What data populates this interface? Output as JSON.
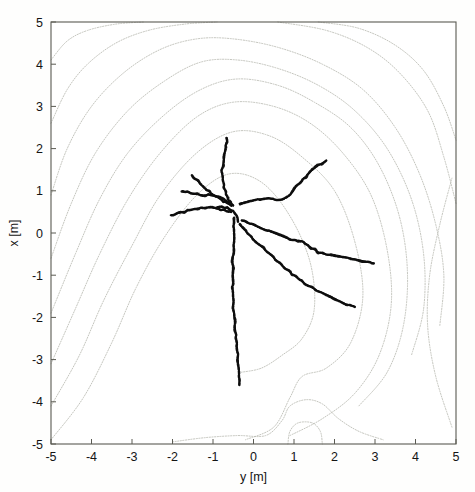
{
  "figure": {
    "background_color": "#fefefd",
    "frame_color": "#5a5a52",
    "contour_color": "#b9bab2",
    "trajectory_color": "#121212"
  },
  "chart_data": {
    "type": "line",
    "title": "",
    "subtitle": "",
    "xlabel": "y [m]",
    "ylabel": "x [m]",
    "xlim": [
      -5,
      5
    ],
    "ylim": [
      -5,
      5
    ],
    "xticks": [
      -5,
      -4,
      -3,
      -2,
      -1,
      0,
      1,
      2,
      3,
      4,
      5
    ],
    "yticks": [
      -5,
      -4,
      -3,
      -2,
      -1,
      0,
      1,
      2,
      3,
      4,
      5
    ],
    "xticklabels": [
      "-5",
      "-4",
      "-3",
      "-2",
      "-1",
      "0",
      "1",
      "2",
      "3",
      "4",
      "5"
    ],
    "yticklabels": [
      "-5",
      "-4",
      "-3",
      "-2",
      "-1",
      "0",
      "1",
      "2",
      "3",
      "4",
      "5"
    ],
    "grid": false,
    "legend": null,
    "annotations": [],
    "series": [
      {
        "name": "contour-level-1-outermost",
        "kind": "contour",
        "points": [
          [
            -5.0,
            4.1
          ],
          [
            -4.6,
            4.55
          ],
          [
            -4.1,
            4.8
          ],
          [
            -3.4,
            4.95
          ],
          [
            -2.7,
            5.0
          ]
        ]
      },
      {
        "name": "contour-level-1-right",
        "kind": "contour",
        "points": [
          [
            1.6,
            5.0
          ],
          [
            2.6,
            4.85
          ],
          [
            3.5,
            4.45
          ],
          [
            4.2,
            3.85
          ],
          [
            4.7,
            3.0
          ],
          [
            5.0,
            2.2
          ]
        ]
      },
      {
        "name": "contour-level-2",
        "kind": "contour",
        "points": [
          [
            -5.0,
            2.6
          ],
          [
            -4.6,
            3.4
          ],
          [
            -4.1,
            4.0
          ],
          [
            -3.4,
            4.5
          ],
          [
            -2.6,
            4.8
          ],
          [
            -1.7,
            4.95
          ],
          [
            -0.9,
            5.0
          ]
        ]
      },
      {
        "name": "contour-level-2-right",
        "kind": "contour",
        "points": [
          [
            0.6,
            5.0
          ],
          [
            1.8,
            4.8
          ],
          [
            2.8,
            4.4
          ],
          [
            3.6,
            3.8
          ],
          [
            4.3,
            2.9
          ],
          [
            4.7,
            1.8
          ],
          [
            5.0,
            0.7
          ]
        ]
      },
      {
        "name": "contour-level-3",
        "kind": "contour",
        "points": [
          [
            -5.0,
            0.9
          ],
          [
            -4.6,
            2.0
          ],
          [
            -4.0,
            3.0
          ],
          [
            -3.2,
            3.8
          ],
          [
            -2.3,
            4.35
          ],
          [
            -1.4,
            4.6
          ],
          [
            -0.5,
            4.6
          ],
          [
            0.6,
            4.4
          ],
          [
            1.7,
            4.0
          ],
          [
            2.7,
            3.4
          ],
          [
            3.5,
            2.5
          ],
          [
            4.1,
            1.4
          ],
          [
            4.5,
            0.2
          ],
          [
            4.7,
            -1.0
          ],
          [
            4.6,
            -2.2
          ]
        ]
      },
      {
        "name": "contour-level-4",
        "kind": "contour",
        "points": [
          [
            -5.0,
            -0.6
          ],
          [
            -4.5,
            0.7
          ],
          [
            -3.9,
            1.9
          ],
          [
            -3.1,
            2.9
          ],
          [
            -2.2,
            3.6
          ],
          [
            -1.3,
            4.05
          ],
          [
            -0.4,
            4.1
          ],
          [
            0.6,
            3.9
          ],
          [
            1.6,
            3.5
          ],
          [
            2.5,
            2.9
          ],
          [
            3.3,
            2.0
          ],
          [
            3.9,
            0.8
          ],
          [
            4.2,
            -0.5
          ],
          [
            4.2,
            -1.8
          ],
          [
            3.9,
            -2.9
          ]
        ]
      },
      {
        "name": "contour-level-5",
        "kind": "contour",
        "points": [
          [
            -5.0,
            -1.9
          ],
          [
            -4.4,
            -0.5
          ],
          [
            -3.8,
            0.8
          ],
          [
            -3.1,
            1.9
          ],
          [
            -2.2,
            2.8
          ],
          [
            -1.3,
            3.4
          ],
          [
            -0.4,
            3.65
          ],
          [
            0.6,
            3.5
          ],
          [
            1.5,
            3.1
          ],
          [
            2.4,
            2.5
          ],
          [
            3.1,
            1.6
          ],
          [
            3.6,
            0.4
          ],
          [
            3.8,
            -0.9
          ],
          [
            3.7,
            -2.2
          ],
          [
            3.3,
            -3.3
          ],
          [
            2.6,
            -4.1
          ]
        ]
      },
      {
        "name": "contour-level-6",
        "kind": "contour",
        "points": [
          [
            -5.0,
            -3.1
          ],
          [
            -4.4,
            -1.8
          ],
          [
            -3.8,
            -0.5
          ],
          [
            -3.1,
            0.8
          ],
          [
            -2.3,
            1.9
          ],
          [
            -1.4,
            2.75
          ],
          [
            -0.5,
            3.1
          ],
          [
            0.5,
            3.0
          ],
          [
            1.4,
            2.6
          ],
          [
            2.2,
            1.9
          ],
          [
            2.9,
            0.9
          ],
          [
            3.3,
            -0.4
          ],
          [
            3.4,
            -1.7
          ],
          [
            3.1,
            -2.9
          ],
          [
            2.5,
            -3.8
          ],
          [
            1.7,
            -4.4
          ],
          [
            0.9,
            -4.8
          ]
        ]
      },
      {
        "name": "contour-level-7",
        "kind": "contour",
        "points": [
          [
            -5.0,
            -4.1
          ],
          [
            -4.3,
            -2.9
          ],
          [
            -3.7,
            -1.6
          ],
          [
            -3.0,
            -0.3
          ],
          [
            -2.3,
            0.9
          ],
          [
            -1.4,
            1.9
          ],
          [
            -0.5,
            2.4
          ],
          [
            0.4,
            2.3
          ],
          [
            1.2,
            1.8
          ],
          [
            2.0,
            1.0
          ],
          [
            2.5,
            -0.2
          ],
          [
            2.7,
            -1.5
          ],
          [
            2.4,
            -2.6
          ],
          [
            1.8,
            -3.2
          ],
          [
            1.2,
            -3.4
          ],
          [
            0.9,
            -3.9
          ],
          [
            0.5,
            -4.6
          ],
          [
            -0.2,
            -4.9
          ]
        ]
      },
      {
        "name": "contour-level-8-inner",
        "kind": "contour",
        "points": [
          [
            -5.0,
            -4.9
          ],
          [
            -4.2,
            -3.9
          ],
          [
            -3.5,
            -2.6
          ],
          [
            -2.9,
            -1.3
          ],
          [
            -2.2,
            -0.1
          ],
          [
            -1.4,
            0.9
          ],
          [
            -0.6,
            1.4
          ],
          [
            0.2,
            1.2
          ],
          [
            0.9,
            0.4
          ],
          [
            1.4,
            -0.7
          ],
          [
            1.5,
            -1.8
          ],
          [
            1.2,
            -2.5
          ],
          [
            0.7,
            -2.9
          ],
          [
            0.2,
            -3.2
          ],
          [
            -0.3,
            -3.3
          ]
        ]
      },
      {
        "name": "contour-saddle-lower",
        "kind": "contour",
        "points": [
          [
            -2.0,
            -4.95
          ],
          [
            -1.2,
            -4.85
          ],
          [
            -0.4,
            -4.8
          ],
          [
            0.3,
            -4.8
          ],
          [
            0.7,
            -4.45
          ],
          [
            0.9,
            -4.1
          ],
          [
            1.3,
            -3.95
          ],
          [
            1.7,
            -4.05
          ],
          [
            2.1,
            -4.4
          ],
          [
            2.6,
            -4.7
          ],
          [
            3.2,
            -4.9
          ]
        ]
      },
      {
        "name": "contour-saddle-notch",
        "kind": "contour",
        "points": [
          [
            0.85,
            -5.0
          ],
          [
            0.9,
            -4.7
          ],
          [
            1.1,
            -4.5
          ],
          [
            1.45,
            -4.5
          ],
          [
            1.65,
            -4.7
          ],
          [
            1.7,
            -5.0
          ]
        ]
      },
      {
        "name": "contour-right-lobe",
        "kind": "contour",
        "points": [
          [
            4.9,
            -4.6
          ],
          [
            4.5,
            -3.4
          ],
          [
            4.3,
            -2.2
          ],
          [
            4.35,
            -1.0
          ],
          [
            4.6,
            0.2
          ],
          [
            4.9,
            1.3
          ]
        ]
      },
      {
        "name": "trajectory-north",
        "kind": "trajectory",
        "points": [
          [
            -0.65,
            2.25
          ],
          [
            -0.7,
            2.0
          ],
          [
            -0.72,
            1.75
          ],
          [
            -0.78,
            1.5
          ],
          [
            -0.75,
            1.25
          ],
          [
            -0.7,
            1.0
          ],
          [
            -0.62,
            0.78
          ],
          [
            -0.5,
            0.65
          ]
        ]
      },
      {
        "name": "trajectory-northwest",
        "kind": "trajectory",
        "points": [
          [
            -1.5,
            1.35
          ],
          [
            -1.35,
            1.2
          ],
          [
            -1.2,
            1.05
          ],
          [
            -1.05,
            0.95
          ],
          [
            -0.9,
            0.85
          ],
          [
            -0.75,
            0.75
          ],
          [
            -0.55,
            0.65
          ]
        ]
      },
      {
        "name": "trajectory-west-upper",
        "kind": "trajectory",
        "points": [
          [
            -1.75,
            1.0
          ],
          [
            -1.55,
            0.95
          ],
          [
            -1.3,
            0.9
          ],
          [
            -1.05,
            0.9
          ],
          [
            -0.85,
            0.85
          ],
          [
            -0.6,
            0.72
          ]
        ]
      },
      {
        "name": "trajectory-west-lower",
        "kind": "trajectory",
        "points": [
          [
            -2.05,
            0.42
          ],
          [
            -1.8,
            0.48
          ],
          [
            -1.55,
            0.55
          ],
          [
            -1.3,
            0.6
          ],
          [
            -1.05,
            0.6
          ],
          [
            -0.8,
            0.55
          ],
          [
            -0.55,
            0.5
          ]
        ]
      },
      {
        "name": "trajectory-south",
        "kind": "trajectory",
        "points": [
          [
            -0.5,
            0.35
          ],
          [
            -0.48,
            0.0
          ],
          [
            -0.5,
            -0.5
          ],
          [
            -0.52,
            -1.0
          ],
          [
            -0.5,
            -1.5
          ],
          [
            -0.48,
            -2.0
          ],
          [
            -0.42,
            -2.5
          ],
          [
            -0.38,
            -3.0
          ],
          [
            -0.35,
            -3.6
          ]
        ]
      },
      {
        "name": "trajectory-northeast",
        "kind": "trajectory",
        "points": [
          [
            -0.35,
            0.7
          ],
          [
            0.0,
            0.78
          ],
          [
            0.35,
            0.82
          ],
          [
            0.65,
            0.78
          ],
          [
            0.9,
            0.9
          ],
          [
            1.1,
            1.15
          ],
          [
            1.35,
            1.4
          ],
          [
            1.6,
            1.6
          ],
          [
            1.8,
            1.72
          ]
        ]
      },
      {
        "name": "trajectory-east",
        "kind": "trajectory",
        "points": [
          [
            -0.3,
            0.3
          ],
          [
            0.1,
            0.15
          ],
          [
            0.5,
            0.0
          ],
          [
            0.9,
            -0.15
          ],
          [
            1.2,
            -0.2
          ],
          [
            1.6,
            -0.45
          ],
          [
            2.0,
            -0.55
          ],
          [
            2.4,
            -0.6
          ],
          [
            2.8,
            -0.68
          ],
          [
            3.0,
            -0.72
          ]
        ]
      },
      {
        "name": "trajectory-southeast",
        "kind": "trajectory",
        "points": [
          [
            -0.35,
            0.2
          ],
          [
            0.0,
            -0.15
          ],
          [
            0.4,
            -0.5
          ],
          [
            0.8,
            -0.85
          ],
          [
            1.2,
            -1.15
          ],
          [
            1.55,
            -1.35
          ],
          [
            1.9,
            -1.5
          ],
          [
            2.2,
            -1.65
          ],
          [
            2.5,
            -1.75
          ]
        ]
      },
      {
        "name": "trajectory-center-cluster",
        "kind": "trajectory",
        "points": [
          [
            -0.9,
            0.62
          ],
          [
            -0.7,
            0.6
          ],
          [
            -0.55,
            0.55
          ],
          [
            -0.42,
            0.42
          ],
          [
            -0.38,
            0.25
          ]
        ]
      }
    ]
  },
  "axes": {
    "x_axis_title": "y [m]",
    "y_axis_title": "x [m]"
  }
}
